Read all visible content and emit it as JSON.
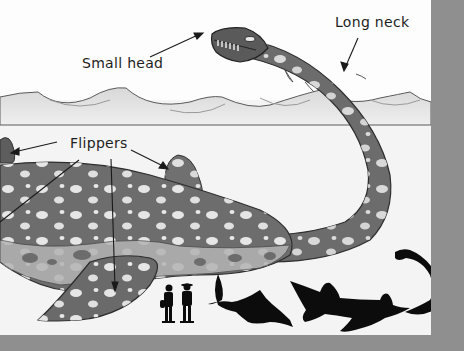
{
  "figure": {
    "labels": [
      {
        "id": "small_head",
        "text": "Small head"
      },
      {
        "id": "long_neck",
        "text": "Long neck"
      },
      {
        "id": "flippers",
        "text": "Flippers"
      }
    ],
    "scale_silhouettes": [
      "two human figures",
      "ichthyosaur",
      "pliosaur",
      "plesiosaur"
    ]
  },
  "labels": {
    "small_head": "Small head",
    "long_neck": "Long neck",
    "flippers": "Flippers"
  },
  "colors": {
    "border": "#8f8f8f",
    "background": "#f4f4f4",
    "body": "#6e6e6e",
    "spots": "#e9e9e9",
    "silhouette": "#0c0c0c"
  }
}
